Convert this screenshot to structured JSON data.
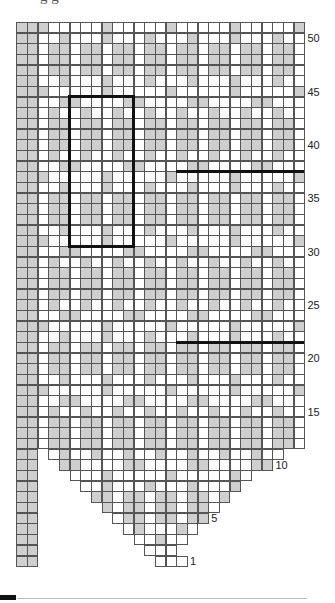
{
  "page": {
    "caption_cropped": "g g"
  },
  "chart_data": {
    "type": "heatmap",
    "rows_total": 51,
    "cols_total": 27,
    "legend": {
      "G": "gray (contrast stitch)",
      ".": "white (main stitch)",
      " ": "no stitch"
    },
    "colors": {
      "gray": "#cfcfcf",
      "white": "#ffffff",
      "grid": "#555555",
      "marker": "#111111"
    },
    "left_border_cols": 2,
    "repeat": {
      "width_stitches": 6,
      "height_rows": 14,
      "outlined_rows": [
        31,
        44
      ],
      "outlined_cols": [
        6,
        11
      ]
    },
    "row_labels": [
      "1",
      "5",
      "10",
      "15",
      "20",
      "25",
      "30",
      "35",
      "40",
      "45",
      "50"
    ],
    "label_rows": [
      1,
      5,
      10,
      15,
      20,
      25,
      30,
      35,
      40,
      45,
      50
    ],
    "section_lines_above_rows": [
      21,
      37
    ],
    "section_lines_from_col": 16,
    "rows": [
      {
        "row": 51,
        "cells": "GGG.....G.....G.....G.....G"
      },
      {
        "row": 50,
        "cells": "GG..G...G...G...G...G...G.."
      },
      {
        "row": 49,
        "cells": "GG.GG.GG.GG.GG.GG.GG.GG.GG."
      },
      {
        "row": 48,
        "cells": "GG.GG.GG.GG.GG.GG.GG.GG.GG."
      },
      {
        "row": 47,
        "cells": "GG.GG.GG.GG.GG.GG.GG.GG.GG."
      },
      {
        "row": 46,
        "cells": "GG..G...G...G...G...G...G.."
      },
      {
        "row": 45,
        "cells": "GGG.....G.....G.....G.....G"
      },
      {
        "row": 44,
        "cells": "GG..GG....GG....GG....GG..."
      },
      {
        "row": 43,
        "cells": "GG.G..G..G..G..G..G..G..G.."
      },
      {
        "row": 42,
        "cells": "GG.GG.GG.GG.GG.GG.GG.GG.GG."
      },
      {
        "row": 41,
        "cells": "GG.GG.GG.GG.GG.GG.GG.GG.GG."
      },
      {
        "row": 40,
        "cells": "GG.GG.GG.GG.GG.GG.GG.GG.GG."
      },
      {
        "row": 39,
        "cells": "GG.G..G..G..G..G..G..G..G.."
      },
      {
        "row": 38,
        "cells": "GG..GG....GG....GG....GG..."
      },
      {
        "row": 37,
        "cells": "GGG.....G.....G.....G.....G"
      },
      {
        "row": 36,
        "cells": "GG..G...G...G...G...G...G.."
      },
      {
        "row": 35,
        "cells": "GG.GG.GG.GG.GG.GG.GG.GG.GG."
      },
      {
        "row": 34,
        "cells": "GG.GG.GG.GG.GG.GG.GG.GG.GG."
      },
      {
        "row": 33,
        "cells": "GG.GG.GG.GG.GG.GG.GG.GG.GG."
      },
      {
        "row": 32,
        "cells": "GG..G...G...G...G...G...G.."
      },
      {
        "row": 31,
        "cells": "GGG.....G.....G.....G.....G"
      },
      {
        "row": 30,
        "cells": "GG..GG....GG....GG....GG..."
      },
      {
        "row": 29,
        "cells": "GG.G..G..G..G..G..G..G..G.."
      },
      {
        "row": 28,
        "cells": "GG.GG.GG.GG.GG.GG.GG.GG.GG."
      },
      {
        "row": 27,
        "cells": "GG.GG.GG.GG.GG.GG.GG.GG.GG."
      },
      {
        "row": 26,
        "cells": "GG.GG.GG.GG.GG.GG.GG.GG.GG."
      },
      {
        "row": 25,
        "cells": "GG.G..G..G..G..G..G..G..G.."
      },
      {
        "row": 24,
        "cells": "GG..GG....GG....GG....GG..."
      },
      {
        "row": 23,
        "cells": "GGG.....G.....G.....G.....G"
      },
      {
        "row": 22,
        "cells": "GG..G...G...G...G...G...G.."
      },
      {
        "row": 21,
        "cells": "GG.GG.GG.GG.GG.GG.GG.GG.GG."
      },
      {
        "row": 20,
        "cells": "GG.GG.GG.GG.GG.GG.GG.GG.GG."
      },
      {
        "row": 19,
        "cells": "GG.GG.GG.GG.GG.GG.GG.GG.GG."
      },
      {
        "row": 18,
        "cells": "GG..G...G...G...G...G...G.."
      },
      {
        "row": 17,
        "cells": "GGG.....G.....G.....G.....G"
      },
      {
        "row": 16,
        "cells": "GG..GG....GG....GG....GG..."
      },
      {
        "row": 15,
        "cells": "GG.G..G..G..G..G..G..G..G.."
      },
      {
        "row": 14,
        "cells": "GG.GG.GG.GG.GG.GG.GG.GG.GG."
      },
      {
        "row": 13,
        "cells": "GG.GG.GG.GG.GG.GG.GG.GG.GG."
      },
      {
        "row": 12,
        "cells": "GG.GG.GG.GG.GG.GG.GG.GG.GG."
      },
      {
        "row": 11,
        "cells": "GG .G..G..G..G..G..G..G..  "
      },
      {
        "row": 10,
        "cells": "GG  GG....GG....GG....GG   "
      },
      {
        "row": 9,
        "cells": "GG   ...G.....G.....G.     "
      },
      {
        "row": 8,
        "cells": "GG    ..G...G...G...G      "
      },
      {
        "row": 7,
        "cells": "GG     GG.GG.GG.GG.G       "
      },
      {
        "row": 6,
        "cells": "GG      G.GG.GG.GG.        "
      },
      {
        "row": 5,
        "cells": "GG       .GG.GG.GG         "
      },
      {
        "row": 4,
        "cells": "GG        .G...G.          "
      },
      {
        "row": 3,
        "cells": "GG         ..G..           "
      },
      {
        "row": 2,
        "cells": "GG          ...            "
      },
      {
        "row": 1,
        "cells": "GG           ...           "
      }
    ]
  }
}
